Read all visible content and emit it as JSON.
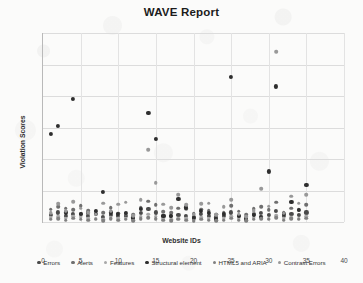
{
  "chart_data": {
    "type": "scatter",
    "title": "WAVE Report",
    "xlabel": "Website IDs",
    "ylabel": "Violation Scores",
    "xlim": [
      0,
      40
    ],
    "ylim": [
      0,
      600
    ],
    "x_ticks": [
      0,
      5,
      10,
      15,
      20,
      25,
      30,
      35,
      40
    ],
    "y_ticks": [
      0,
      100,
      200,
      300,
      400,
      500,
      600
    ],
    "grid": true,
    "legend_position": "bottom",
    "x": [
      1,
      2,
      3,
      4,
      5,
      6,
      7,
      8,
      9,
      10,
      11,
      12,
      13,
      14,
      15,
      16,
      17,
      18,
      19,
      20,
      21,
      22,
      23,
      24,
      25,
      26,
      27,
      28,
      29,
      30,
      31,
      32,
      33,
      34,
      35
    ],
    "series": [
      {
        "name": "Errors",
        "color": "#4a4a4a",
        "values": [
          22,
          30,
          20,
          26,
          24,
          18,
          26,
          16,
          22,
          18,
          20,
          14,
          28,
          42,
          30,
          20,
          18,
          22,
          20,
          16,
          24,
          20,
          14,
          18,
          30,
          20,
          12,
          24,
          28,
          22,
          34,
          20,
          26,
          22,
          30
        ]
      },
      {
        "name": "Alerts",
        "color": "#6f6f6f",
        "values": [
          40,
          48,
          44,
          38,
          52,
          36,
          34,
          30,
          46,
          28,
          26,
          22,
          46,
          66,
          54,
          32,
          30,
          44,
          42,
          26,
          40,
          36,
          24,
          30,
          52,
          34,
          22,
          42,
          48,
          38,
          62,
          30,
          44,
          38,
          54
        ]
      },
      {
        "name": "Features",
        "color": "#a8a8a8",
        "values": [
          14,
          16,
          12,
          18,
          16,
          10,
          12,
          8,
          14,
          10,
          12,
          6,
          16,
          24,
          18,
          10,
          8,
          12,
          10,
          8,
          14,
          10,
          6,
          10,
          18,
          10,
          6,
          14,
          16,
          12,
          20,
          10,
          14,
          12,
          18
        ]
      },
      {
        "name": "Structural element",
        "color": "#2e2e2e",
        "values": [
          280,
          305,
          30,
          390,
          24,
          28,
          34,
          96,
          30,
          26,
          28,
          12,
          42,
          345,
          262,
          20,
          18,
          74,
          46,
          12,
          34,
          28,
          8,
          26,
          460,
          18,
          10,
          22,
          16,
          160,
          430,
          24,
          62,
          38,
          118
        ]
      },
      {
        "name": "HTML5 and ARIA",
        "color": "#808080",
        "values": [
          8,
          10,
          6,
          12,
          8,
          6,
          8,
          4,
          10,
          6,
          8,
          4,
          10,
          14,
          10,
          6,
          4,
          8,
          6,
          4,
          8,
          6,
          4,
          6,
          12,
          6,
          4,
          8,
          10,
          8,
          14,
          6,
          10,
          8,
          12
        ]
      },
      {
        "name": "Contrast Errors",
        "color": "#999999",
        "values": [
          30,
          58,
          36,
          64,
          44,
          30,
          24,
          60,
          34,
          56,
          62,
          20,
          70,
          230,
          125,
          56,
          46,
          86,
          54,
          24,
          58,
          60,
          22,
          48,
          70,
          24,
          16,
          36,
          106,
          50,
          540,
          28,
          82,
          60,
          86
        ]
      }
    ]
  }
}
